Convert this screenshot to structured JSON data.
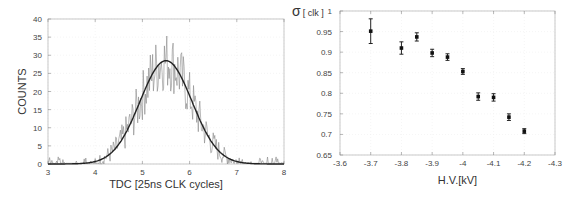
{
  "chart_data": [
    {
      "type": "line",
      "title": "",
      "xlabel": "TDC [25ns CLK cycles]",
      "ylabel": "COUNTS",
      "xlim": [
        3,
        8
      ],
      "ylim": [
        0,
        40
      ],
      "xticks": [
        "3",
        "4",
        "5",
        "6",
        "7",
        "8"
      ],
      "yticks": [
        "0",
        "5",
        "10",
        "15",
        "20",
        "25",
        "30",
        "35",
        "40"
      ],
      "grid": true,
      "series": [
        {
          "name": "histogram",
          "style": "noisy gray histogram",
          "x": [
            3.0,
            3.5,
            4.0,
            4.25,
            4.5,
            4.75,
            5.0,
            5.25,
            5.4,
            5.5,
            5.6,
            5.75,
            6.0,
            6.25,
            6.5,
            6.75,
            7.0,
            7.5,
            8.0
          ],
          "values": [
            0.5,
            0.5,
            1,
            3,
            7,
            14,
            22,
            28,
            36,
            30,
            35,
            27,
            20,
            12,
            7,
            3,
            1,
            0.5,
            0.3
          ]
        },
        {
          "name": "gaussian fit",
          "style": "smooth black curve",
          "peak_x": 5.5,
          "peak_y": 28.5,
          "sigma": 0.55
        }
      ]
    },
    {
      "type": "scatter",
      "title": "",
      "xlabel": "H.V.[kV]",
      "ylabel": "σ [ clk ]",
      "xlim": [
        -3.6,
        -4.3
      ],
      "ylim": [
        0.65,
        1.0
      ],
      "xticks": [
        "-3.6",
        "-3.7",
        "-3.8",
        "-3.9",
        "-4",
        "-4.1",
        "-4.2",
        "-4.3"
      ],
      "yticks": [
        "0.65",
        "0.7",
        "0.75",
        "0.8",
        "0.85",
        "0.9",
        "0.95",
        "1"
      ],
      "grid": true,
      "series": [
        {
          "name": "sigma vs HV",
          "x": [
            -3.7,
            -3.8,
            -3.85,
            -3.9,
            -3.95,
            -4.0,
            -4.05,
            -4.1,
            -4.15,
            -4.2
          ],
          "values": [
            0.951,
            0.91,
            0.937,
            0.898,
            0.888,
            0.853,
            0.792,
            0.79,
            0.742,
            0.708
          ],
          "errors": [
            0.03,
            0.015,
            0.01,
            0.009,
            0.008,
            0.007,
            0.009,
            0.009,
            0.008,
            0.006
          ]
        }
      ]
    }
  ]
}
